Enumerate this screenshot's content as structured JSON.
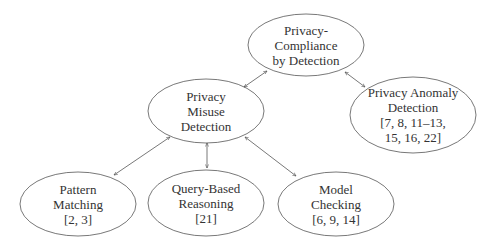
{
  "diagram": {
    "type": "hierarchy",
    "colors": {
      "stroke": "#555555",
      "text": "#333333",
      "background": "#ffffff"
    },
    "nodes": [
      {
        "id": "root",
        "lines": [
          "Privacy-",
          "Compliance",
          "by Detection"
        ],
        "cx": 306,
        "cy": 45,
        "rx": 58,
        "ry": 31
      },
      {
        "id": "misuse",
        "lines": [
          "Privacy",
          "Misuse",
          "Detection"
        ],
        "cx": 206,
        "cy": 111,
        "rx": 58,
        "ry": 32
      },
      {
        "id": "anomaly",
        "lines": [
          "Privacy Anomaly",
          "Detection",
          "[7, 8, 11–13,",
          "15, 16, 22]"
        ],
        "cx": 413,
        "cy": 115,
        "rx": 63,
        "ry": 38
      },
      {
        "id": "pattern",
        "lines": [
          "Pattern",
          "Matching",
          "[2, 3]"
        ],
        "cx": 78,
        "cy": 204,
        "rx": 58,
        "ry": 32
      },
      {
        "id": "query",
        "lines": [
          "Query-Based",
          "Reasoning",
          "[21]"
        ],
        "cx": 206,
        "cy": 203,
        "rx": 58,
        "ry": 33
      },
      {
        "id": "model",
        "lines": [
          "Model",
          "Checking",
          "[6, 9, 14]"
        ],
        "cx": 336,
        "cy": 204,
        "rx": 58,
        "ry": 32
      }
    ],
    "edges": [
      {
        "from": "misuse",
        "to": "root",
        "x1": 244,
        "y1": 87,
        "x2": 267,
        "y2": 71,
        "arrows": "both"
      },
      {
        "from": "root",
        "to": "anomaly",
        "x1": 345,
        "y1": 72,
        "x2": 365,
        "y2": 87,
        "arrows": "both"
      },
      {
        "from": "pattern",
        "to": "misuse",
        "x1": 114,
        "y1": 175,
        "x2": 170,
        "y2": 137,
        "arrows": "both"
      },
      {
        "from": "query",
        "to": "misuse",
        "x1": 207,
        "y1": 168,
        "x2": 207,
        "y2": 143,
        "arrows": "both"
      },
      {
        "from": "model",
        "to": "misuse",
        "x1": 296,
        "y1": 176,
        "x2": 245,
        "y2": 137,
        "arrows": "both"
      }
    ]
  }
}
